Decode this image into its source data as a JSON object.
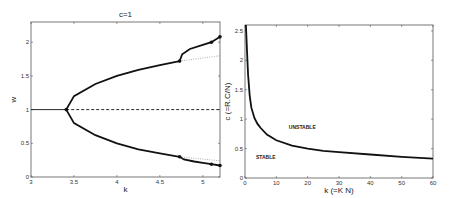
{
  "chart_data": [
    {
      "type": "line",
      "title": "c=1",
      "xlabel": "k",
      "ylabel": "w",
      "xlim": [
        3,
        5.2
      ],
      "ylim": [
        0,
        2.3
      ],
      "xticks": [
        "3",
        "3.5",
        "4",
        "4.5",
        "5"
      ],
      "yticks": [
        "0",
        "0.5",
        "1",
        "1.5",
        "2"
      ],
      "grid": false,
      "series": [
        {
          "name": "trivial stable",
          "style": "solid",
          "x": [
            3,
            3.41
          ],
          "y": [
            1,
            1
          ]
        },
        {
          "name": "trivial unstable",
          "style": "dashed",
          "x": [
            3.41,
            5.2
          ],
          "y": [
            1,
            1
          ]
        },
        {
          "name": "upper branch",
          "style": "solid-bold",
          "x": [
            3.41,
            3.5,
            3.75,
            4.0,
            4.25,
            4.5,
            4.73
          ],
          "y": [
            1.0,
            1.2,
            1.38,
            1.5,
            1.59,
            1.66,
            1.72
          ]
        },
        {
          "name": "lower branch",
          "style": "solid-bold",
          "x": [
            3.41,
            3.5,
            3.75,
            4.0,
            4.25,
            4.5,
            4.73
          ],
          "y": [
            1.0,
            0.8,
            0.62,
            0.5,
            0.41,
            0.35,
            0.3
          ]
        },
        {
          "name": "upper secondary",
          "style": "solid-bold",
          "x": [
            4.73,
            4.76,
            4.85,
            5.0,
            5.1,
            5.2
          ],
          "y": [
            1.72,
            1.82,
            1.9,
            1.96,
            2.0,
            2.08
          ]
        },
        {
          "name": "lower secondary",
          "style": "solid-bold",
          "x": [
            4.73,
            4.78,
            4.9,
            5.0,
            5.1,
            5.2
          ],
          "y": [
            0.3,
            0.26,
            0.23,
            0.21,
            0.19,
            0.17
          ]
        },
        {
          "name": "upper continuation",
          "style": "dotted",
          "x": [
            4.73,
            5.2
          ],
          "y": [
            1.72,
            1.8
          ]
        },
        {
          "name": "lower continuation",
          "style": "dotted",
          "x": [
            4.73,
            5.2
          ],
          "y": [
            0.3,
            0.24
          ]
        }
      ],
      "markers": [
        {
          "x": 3.41,
          "y": 1.0
        },
        {
          "x": 4.73,
          "y": 1.72
        },
        {
          "x": 4.73,
          "y": 0.3
        },
        {
          "x": 5.1,
          "y": 2.0
        },
        {
          "x": 5.2,
          "y": 2.08
        },
        {
          "x": 5.1,
          "y": 0.19
        },
        {
          "x": 5.2,
          "y": 0.17
        }
      ]
    },
    {
      "type": "line",
      "title": "",
      "xlabel": "k (=K N)",
      "ylabel": "c (=R.C/N)",
      "xlim": [
        0,
        60
      ],
      "ylim": [
        0,
        2.6
      ],
      "xticks": [
        "0",
        "10",
        "20",
        "30",
        "40",
        "50",
        "60"
      ],
      "yticks": [
        "0",
        "0.5",
        "1",
        "1.5",
        "2",
        "2.5"
      ],
      "grid": false,
      "annotations": [
        {
          "text": "UNSTABLE",
          "x": 14,
          "y": 0.83
        },
        {
          "text": "STABLE",
          "x": 3.5,
          "y": 0.33
        }
      ],
      "series": [
        {
          "name": "stability boundary",
          "x": [
            0.3,
            0.6,
            1,
            1.5,
            2,
            3,
            4,
            5,
            7,
            10,
            15,
            20,
            25,
            30,
            40,
            50,
            60
          ],
          "y": [
            2.6,
            2.2,
            1.75,
            1.4,
            1.2,
            1.02,
            0.92,
            0.85,
            0.74,
            0.64,
            0.55,
            0.5,
            0.46,
            0.44,
            0.4,
            0.36,
            0.33
          ]
        }
      ]
    }
  ]
}
